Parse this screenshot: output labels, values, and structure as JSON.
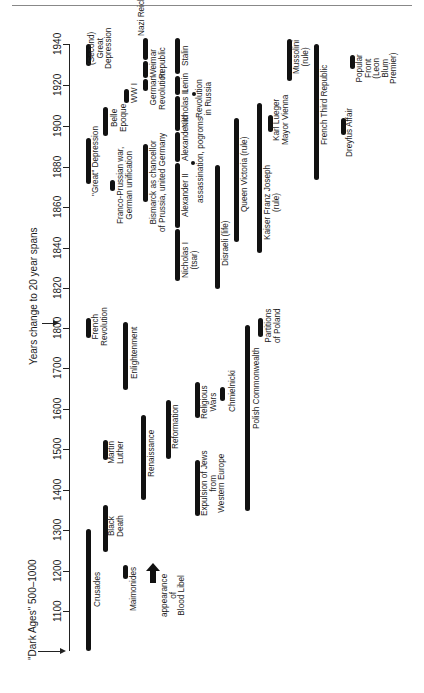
{
  "axis": {
    "ticks": [
      {
        "label": "1940",
        "y": 44
      },
      {
        "label": "1920",
        "y": 85
      },
      {
        "label": "1900",
        "y": 126
      },
      {
        "label": "1880",
        "y": 167
      },
      {
        "label": "1860",
        "y": 207
      },
      {
        "label": "1840",
        "y": 248
      },
      {
        "label": "1820",
        "y": 288
      },
      {
        "label": "1800",
        "y": 328
      },
      {
        "label": "1700",
        "y": 368
      },
      {
        "label": "1600",
        "y": 409
      },
      {
        "label": "1500",
        "y": 449
      },
      {
        "label": "1400",
        "y": 490
      },
      {
        "label": "1300",
        "y": 530
      },
      {
        "label": "1200",
        "y": 571
      },
      {
        "label": "1100",
        "y": 611
      }
    ]
  },
  "notes": {
    "scale_change": "Years change to 20 year spans",
    "dark_ages": "\"Dark Ages\" 500–1000"
  },
  "events": [
    {
      "id": "crusades",
      "label": "Crusades",
      "start": 1096,
      "end": 1300
    },
    {
      "id": "maimonides",
      "label": "Maimonides",
      "start": 1180,
      "end": 1204
    },
    {
      "id": "blood-libel",
      "label": "appearance of Blood Libel",
      "start": 1200,
      "marker": "arrow"
    },
    {
      "id": "black-death",
      "label": "Black Death",
      "start": 1250,
      "end": 1360
    },
    {
      "id": "renaissance",
      "label": "Renaissance",
      "start": 1375,
      "end": 1580
    },
    {
      "id": "martin-luther",
      "label": "Martin Luther",
      "start": 1483,
      "end": 1520
    },
    {
      "id": "expulsion",
      "label": "Expulsion of Jews from Western Europe",
      "start": 1340,
      "end": 1475
    },
    {
      "id": "reformation",
      "label": "Reformation",
      "start": 1480,
      "end": 1620
    },
    {
      "id": "religious-wars",
      "label": "Religious Wars",
      "start": 1580,
      "end": 1660
    },
    {
      "id": "chmielnicki",
      "label": "Chmielnicki",
      "start": 1645,
      "end": 1660
    },
    {
      "id": "enlightenment",
      "label": "Enlightenment",
      "start": 1650,
      "end": 1810
    },
    {
      "id": "polish-commonwealth",
      "label": "Polish Commonwealth",
      "start": 1500,
      "end": 1800
    },
    {
      "id": "partitions-poland",
      "label": "Partitions of Poland",
      "start": 1772,
      "end": 1815
    },
    {
      "id": "french-revolution",
      "label": "French Revolution",
      "start": 1789,
      "end": 1815
    },
    {
      "id": "nicholas-i",
      "label": "Nicholas I (tsar)",
      "start": 1825,
      "end": 1855
    },
    {
      "id": "alexander-ii",
      "label": "Alexander II",
      "start": 1855,
      "end": 1881
    },
    {
      "id": "alexander-iii",
      "label": "Alexander III",
      "start": 1881,
      "end": 1894
    },
    {
      "id": "nicholas-ii",
      "label": "Nicholas II",
      "start": 1894,
      "end": 1917
    },
    {
      "id": "lenin",
      "label": "Lenin",
      "start": 1917,
      "end": 1924
    },
    {
      "id": "stalin",
      "label": "Stalin",
      "start": 1924,
      "end": 1953
    },
    {
      "id": "assassination-pogroms",
      "label": "assassination, pogroms",
      "start": 1881,
      "marker": "dot"
    },
    {
      "id": "revolution-russia",
      "label": "Revolution in Russia",
      "start": 1917,
      "marker": "dot"
    },
    {
      "id": "disraeli",
      "label": "Disraeli (life)",
      "start": 1804,
      "end": 1881
    },
    {
      "id": "queen-victoria",
      "label": "Queen Victoria (rule)",
      "start": 1837,
      "end": 1901
    },
    {
      "id": "franz-joseph",
      "label": "Kaiser Franz Joseph (rule)",
      "start": 1848,
      "end": 1916
    },
    {
      "id": "karl-lueger",
      "label": "Karl Lueger Mayor Vienna",
      "start": 1897,
      "end": 1910
    },
    {
      "id": "bismarck",
      "label": "Bismarck as chancellor of Prussia, united Germany",
      "start": 1862,
      "end": 1890
    },
    {
      "id": "franco-prussian",
      "label": "Franco-Prussian war, German unification",
      "start": 1870,
      "end": 1871
    },
    {
      "id": "great-depression-1",
      "label": "\"Great\" Depression",
      "start": 1873,
      "end": 1896
    },
    {
      "id": "belle-epoque",
      "label": "Belle Epoque",
      "start": 1890,
      "end": 1914
    },
    {
      "id": "ww1",
      "label": "WW I",
      "start": 1914,
      "end": 1918
    },
    {
      "id": "german-revolution",
      "label": "German Revolution",
      "start": 1918,
      "end": 1919
    },
    {
      "id": "weimar",
      "label": "Weimar Republic",
      "start": 1919,
      "end": 1933
    },
    {
      "id": "nazi-reich",
      "label": "Nazi Reich",
      "start": 1933,
      "end": 1945
    },
    {
      "id": "second-great-depression",
      "label": "(Second) Great Depression",
      "start": 1929,
      "end": 1939
    },
    {
      "id": "french-third-republic",
      "label": "French Third Republic",
      "start": 1870,
      "end": 1940
    },
    {
      "id": "dreyfus",
      "label": "Dreyfus Affair",
      "start": 1894,
      "end": 1906
    },
    {
      "id": "mussolini",
      "label": "Mussolini (rule)",
      "start": 1922,
      "end": 1943
    },
    {
      "id": "popular-front",
      "label": "Popular Front (Leon Blum Premier)",
      "start": 1936,
      "end": 1938
    }
  ],
  "labels": {
    "crusades": "Crusades",
    "maimonides": "Maimonides",
    "blood_libel": [
      "appearance",
      "of",
      "Blood Libel"
    ],
    "black_death": [
      "Black",
      "Death"
    ],
    "renaissance": "Renaissance",
    "martin_luther": [
      "Martin",
      "Luther"
    ],
    "expulsion": [
      "Expulsion of Jews",
      "from",
      "Western Europe"
    ],
    "reformation": "Reformation",
    "religious_wars": [
      "Religious",
      "Wars"
    ],
    "chmielnicki": "Chmielnicki",
    "enlightenment": "Enlightenment",
    "polish_commonwealth": "Polish Commonwealth",
    "partitions_poland": [
      "Partitions",
      "of Poland"
    ],
    "french_revolution": [
      "French",
      "Revolution"
    ],
    "nicholas_i": [
      "Nicholas I",
      "(tsar)"
    ],
    "alexander_ii": "Alexander II",
    "alexander_iii": "Alexander III",
    "nicholas_ii": "Nicholas II",
    "lenin": "Lenin",
    "stalin": "Stalin",
    "assassination": "assassination, pogroms",
    "revolution_russia": [
      "Revolution",
      "in Russia"
    ],
    "disraeli": "Disraeli (life)",
    "queen_victoria": "Queen Victoria (rule)",
    "franz_joseph": [
      "Kaiser Franz Joseph",
      "(rule)"
    ],
    "karl_lueger": [
      "Karl Lueger",
      "Mayor Vienna"
    ],
    "bismarck": [
      "Bismarck as chancellor",
      "of Prussia, united Germany"
    ],
    "franco_prussian": [
      "Franco-Prussian war,",
      "German unification"
    ],
    "great_depression": "\"Great\" Depression",
    "belle_epoque": [
      "Belle",
      "Epoque"
    ],
    "ww1": "WW I",
    "german_revolution": [
      "German",
      "Revolution"
    ],
    "weimar": [
      "Weimar",
      "Republic"
    ],
    "nazi_reich": "Nazi Reich",
    "second_depression": [
      "(Second)",
      "Great",
      "Depression"
    ],
    "french_third_republic": "French Third Republic",
    "dreyfus": "Dreyfus Affair",
    "mussolini": [
      "Mussolini",
      "(rule)"
    ],
    "popular_front": [
      "Popular",
      "Front",
      "(Leon",
      "Blum",
      "Premier)"
    ]
  }
}
